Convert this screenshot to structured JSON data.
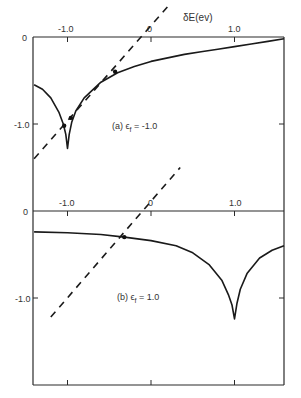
{
  "chart_data": [
    {
      "type": "line",
      "panel": "a",
      "annotation": "(a) ϵf = -1.0",
      "xlabel": "δE(ev)",
      "ylabel": "",
      "xticks": [
        "-1.0",
        "0",
        "1.0"
      ],
      "yticks": [
        "0",
        "-1.0"
      ],
      "xlim": [
        -1.4,
        1.6
      ],
      "ylim": [
        -1.9,
        0
      ],
      "grid": false,
      "series": [
        {
          "name": "curve",
          "style": "solid",
          "x": [
            -1.4,
            -1.3,
            -1.2,
            -1.1,
            -1.05,
            -1.02,
            -1.0,
            -0.98,
            -0.95,
            -0.9,
            -0.8,
            -0.6,
            -0.4,
            -0.2,
            0.0,
            0.2,
            0.4,
            0.6,
            0.8,
            1.0,
            1.2,
            1.4,
            1.6
          ],
          "y": [
            -0.55,
            -0.6,
            -0.7,
            -0.87,
            -1.0,
            -1.12,
            -1.28,
            -1.12,
            -0.98,
            -0.85,
            -0.7,
            -0.52,
            -0.41,
            -0.34,
            -0.28,
            -0.24,
            -0.2,
            -0.17,
            -0.14,
            -0.11,
            -0.08,
            -0.05,
            -0.02
          ]
        },
        {
          "name": "line",
          "style": "dashed",
          "x": [
            -1.4,
            0.2
          ],
          "y": [
            -1.4,
            0.35
          ]
        }
      ],
      "intersections": [
        {
          "x": -1.04,
          "y": -1.02
        },
        {
          "x": -0.96,
          "y": -0.93
        },
        {
          "x": -0.43,
          "y": -0.4
        }
      ]
    },
    {
      "type": "line",
      "panel": "b",
      "annotation": "(b) ϵf = 1.0",
      "xlabel": "",
      "ylabel": "",
      "xticks": [
        "-1.0",
        "0",
        "1.0"
      ],
      "yticks": [
        "0",
        "-1.0"
      ],
      "xlim": [
        -1.4,
        1.6
      ],
      "ylim": [
        -2.0,
        0
      ],
      "grid": false,
      "series": [
        {
          "name": "curve",
          "style": "solid",
          "x": [
            -1.4,
            -1.0,
            -0.6,
            -0.32,
            0.0,
            0.3,
            0.5,
            0.7,
            0.85,
            0.93,
            0.97,
            1.0,
            1.03,
            1.07,
            1.15,
            1.3,
            1.45,
            1.6
          ],
          "y": [
            -0.24,
            -0.25,
            -0.27,
            -0.3,
            -0.34,
            -0.4,
            -0.48,
            -0.62,
            -0.8,
            -0.97,
            -1.08,
            -1.24,
            -1.06,
            -0.9,
            -0.72,
            -0.54,
            -0.45,
            -0.4
          ]
        },
        {
          "name": "line",
          "style": "dashed",
          "x": [
            -1.2,
            0.35
          ],
          "y": [
            -1.22,
            0.5
          ]
        }
      ],
      "intersections": [
        {
          "x": -0.32,
          "y": -0.3
        }
      ]
    }
  ],
  "labels": {
    "x_axis_title": "δE(ev)",
    "panel_a": {
      "annotation_prefix": "(a) ϵ",
      "annotation_sub": "f",
      "annotation_suffix": " = -1.0",
      "xtick_labels": [
        "-1.0",
        "0",
        "1.0"
      ],
      "ytick_labels": [
        "0",
        "-1.0"
      ]
    },
    "panel_b": {
      "annotation_prefix": "(b) ϵ",
      "annotation_sub": "f",
      "annotation_suffix": " = 1.0",
      "xtick_labels": [
        "-1.0",
        "0",
        "1.0"
      ],
      "ytick_labels": [
        "0",
        "-1.0"
      ]
    }
  }
}
